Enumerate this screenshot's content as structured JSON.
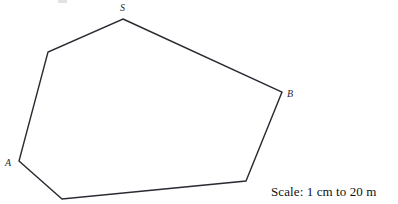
{
  "figure": {
    "stroke_color": "#2a2a33",
    "stroke_width": 1.4,
    "fill_color": "#ffffff",
    "background_color": "#ffffff",
    "canvas": {
      "width": 398,
      "height": 204
    },
    "polygon": {
      "closed": true,
      "points": "123,19 282,92 246,181 62,199 19,161 48,52",
      "vertices": [
        {
          "name": "S",
          "x": 123,
          "y": 19,
          "labeled": true
        },
        {
          "name": "B",
          "x": 282,
          "y": 92,
          "labeled": true
        },
        {
          "name": "corner-bottom-right",
          "x": 246,
          "y": 181,
          "labeled": false
        },
        {
          "name": "corner-bottom-left",
          "x": 62,
          "y": 199,
          "labeled": false
        },
        {
          "name": "A",
          "x": 19,
          "y": 161,
          "labeled": true
        },
        {
          "name": "corner-upper-left",
          "x": 48,
          "y": 52,
          "labeled": false
        }
      ]
    },
    "labels": [
      {
        "id": "S",
        "text": "S",
        "x": 120,
        "y": 3
      },
      {
        "id": "B",
        "text": "B",
        "x": 287,
        "y": 89
      },
      {
        "id": "A",
        "text": "A",
        "x": 5,
        "y": 158
      }
    ]
  },
  "annotations": {
    "scale_note": "Scale: 1 cm to 20 m"
  }
}
